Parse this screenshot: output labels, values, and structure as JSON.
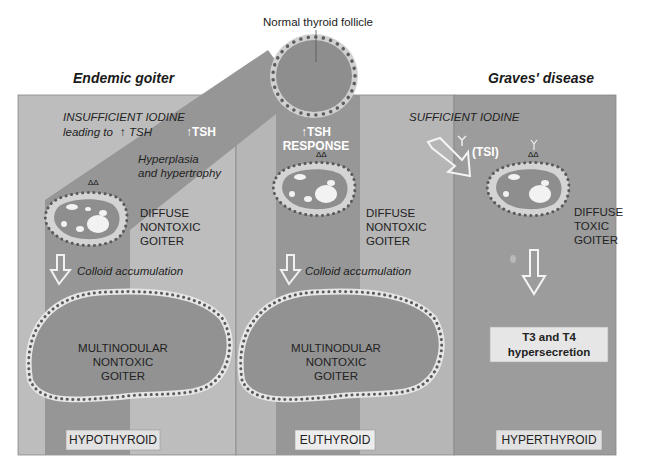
{
  "title": "Normal thyroid follicle",
  "headers": {
    "left": "Endemic goiter",
    "right": "Graves' disease"
  },
  "colors": {
    "panel_light": "#bcbcbc",
    "panel_mid": "#a5a5a5",
    "band": "#8f8f8f",
    "graves_panel": "#9a9a9a",
    "follicle_fill": "#8c8c8c",
    "follicle_ring": "#c8c8c8",
    "dot": "#5a5a5a",
    "label_box": "#e4e4e4"
  },
  "left_column": {
    "condition_line1": "INSUFFICIENT IODINE",
    "condition_line2": "leading to",
    "tsh_arrow": "↑",
    "tsh_text": "TSH",
    "band_label": "↑TSH",
    "process": [
      "Hyperplasia",
      "and hypertrophy"
    ],
    "stage1": [
      "DIFFUSE",
      "NONTOXIC",
      "GOITER"
    ],
    "transition": "Colloid accumulation",
    "stage2": [
      "MULTINODULAR",
      "NONTOXIC",
      "GOITER"
    ],
    "status": "HYPOTHYROID"
  },
  "middle_column": {
    "band_label_line1": "↑TSH",
    "band_label_line2": "RESPONSE",
    "stage1": [
      "DIFFUSE",
      "NONTOXIC",
      "GOITER"
    ],
    "transition": "Colloid accumulation",
    "stage2": [
      "MULTINODULAR",
      "NONTOXIC",
      "GOITER"
    ],
    "status": "EUTHYROID"
  },
  "right_column": {
    "condition": "SUFFICIENT IODINE",
    "antibody_label": "(TSI)",
    "stage1": [
      "DIFFUSE",
      "TOXIC",
      "GOITER"
    ],
    "outcome": [
      "T3 and T4",
      "hypersecretion"
    ],
    "status": "HYPERTHYROID"
  }
}
